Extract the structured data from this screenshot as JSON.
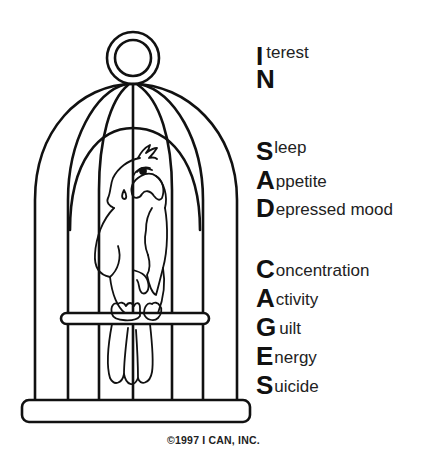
{
  "illustration": {
    "subject": "Sad parrot sitting on a perch inside a birdcage",
    "stroke_color": "#111111",
    "background": "#ffffff"
  },
  "acrostic": {
    "in_group": [
      {
        "initial": "I",
        "rest": "terest"
      },
      {
        "initial": "N",
        "rest": ""
      }
    ],
    "sad_group": [
      {
        "initial": "S",
        "rest": "leep"
      },
      {
        "initial": "A",
        "rest": "ppetite"
      },
      {
        "initial": "D",
        "rest": "epressed mood"
      }
    ],
    "cages_group": [
      {
        "initial": "C",
        "rest": "oncentration"
      },
      {
        "initial": "A",
        "rest": "ctivity"
      },
      {
        "initial": "G",
        "rest": "uilt"
      },
      {
        "initial": "E",
        "rest": "nergy"
      },
      {
        "initial": "S",
        "rest": "uicide"
      }
    ]
  },
  "copyright": "©1997 I CAN, INC."
}
